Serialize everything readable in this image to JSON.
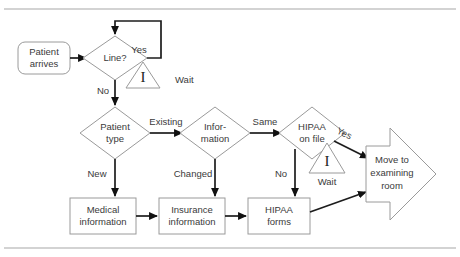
{
  "figure": {
    "type": "flowchart",
    "orientation": "left-to-right",
    "rules": {
      "top": true,
      "bottom": true,
      "color": "#a8a8a8"
    },
    "colors": {
      "shape_stroke": "#9a9a9a",
      "connector": "#6d6d6d",
      "connector_emphasis": "#1d1d1d",
      "text": "#3a3a3a",
      "background": "#ffffff"
    }
  },
  "nodes": {
    "start": {
      "shape": "rounded-rectangle",
      "line1": "Patient",
      "line2": "arrives"
    },
    "line_decision": {
      "shape": "diamond",
      "line1": "Line?"
    },
    "wait_line": {
      "shape": "triangle",
      "glyph": "I",
      "label": "Wait"
    },
    "patient_type": {
      "shape": "diamond",
      "line1": "Patient",
      "line2": "type"
    },
    "information": {
      "shape": "diamond",
      "line1": "Infor-",
      "line2": "mation"
    },
    "hipaa_on_file": {
      "shape": "diamond",
      "line1": "HIPAA",
      "line2": "on file"
    },
    "wait_hipaa": {
      "shape": "triangle",
      "glyph": "I",
      "label": "Wait"
    },
    "medical_information": {
      "shape": "rectangle",
      "line1": "Medical",
      "line2": "information"
    },
    "insurance_information": {
      "shape": "rectangle",
      "line1": "Insurance",
      "line2": "information"
    },
    "hipaa_forms": {
      "shape": "rectangle",
      "line1": "HIPAA",
      "line2": "forms"
    },
    "move_to_exam": {
      "shape": "block-arrow-right",
      "line1": "Move to",
      "line2": "examining",
      "line3": "room"
    }
  },
  "edge_labels": {
    "line_yes": "Yes",
    "line_no": "No",
    "type_existing": "Existing",
    "type_new": "New",
    "information_same": "Same",
    "information_changed": "Changed",
    "hipaa_yes": "Yes",
    "hipaa_no": "No"
  }
}
